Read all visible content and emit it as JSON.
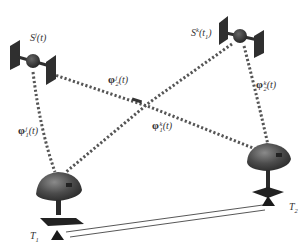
{
  "diagram": {
    "type": "satellite-ranging-geometry",
    "satellites": [
      {
        "id": "j",
        "label_base": "S",
        "label_sup": "j",
        "label_arg": "(t)",
        "x": 33,
        "y": 61
      },
      {
        "id": "k",
        "label_base": "S",
        "label_sup": "k",
        "label_arg": "(t",
        "label_arg_sub": "1",
        "label_arg_close": ")",
        "x": 240,
        "y": 36
      }
    ],
    "stations": [
      {
        "id": "T1",
        "label_base": "T",
        "label_sub": "1",
        "x": 58,
        "y": 188
      },
      {
        "id": "T2",
        "label_base": "T",
        "label_sub": "2",
        "x": 268,
        "y": 160
      }
    ],
    "links": [
      {
        "from": "S^j",
        "to": "T1",
        "label_base": "φ",
        "label_sup": "j",
        "label_sub": "1",
        "label_arg": "(t)"
      },
      {
        "from": "S^j",
        "to": "T2",
        "label_base": "φ",
        "label_sup": "j",
        "label_sub": "2",
        "label_arg": "(t)"
      },
      {
        "from": "S^k",
        "to": "T1",
        "label_base": "φ",
        "label_sup": "k",
        "label_sub": "1",
        "label_arg": "(t)"
      },
      {
        "from": "S^k",
        "to": "T2",
        "label_base": "φ",
        "label_sup": "k",
        "label_sub": "2",
        "label_arg": "(t)"
      }
    ],
    "baseline": {
      "from": "T1",
      "to": "T2",
      "style": "double-line"
    },
    "colors": {
      "link": "#555555",
      "satellite": "#2f2f2f",
      "station_dome": "#4a4a4a",
      "station_base": "#222222",
      "baseline": "#444444"
    }
  }
}
